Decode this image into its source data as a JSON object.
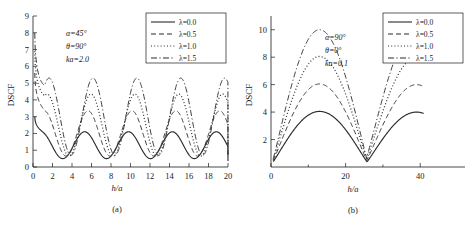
{
  "figure": {
    "panels": [
      {
        "caption": "(a)",
        "annotations": [
          "α=45°",
          "θ=90°",
          "ka=2.0"
        ],
        "xlabel": "h/a",
        "ylabel": "DSCF"
      },
      {
        "caption": "(b)",
        "annotations": [
          "α=90°",
          "θ=0°",
          "ka=0.1"
        ],
        "xlabel": "h/a",
        "ylabel": "DSCF"
      }
    ],
    "legend_labels": [
      "λ=0.0",
      "λ=0.5",
      "λ=1.0",
      "λ=1.5"
    ]
  },
  "chart_data": [
    {
      "type": "line",
      "title": "",
      "panel": "(a)",
      "xlabel": "h/a",
      "ylabel": "DSCF",
      "xlim": [
        0,
        20
      ],
      "ylim": [
        0,
        9
      ],
      "xticks": [
        0,
        2,
        4,
        6,
        8,
        10,
        12,
        14,
        16,
        18,
        20
      ],
      "yticks": [
        0,
        1,
        2,
        3,
        4,
        5,
        6,
        7,
        8,
        9
      ],
      "grid": false,
      "legend_position": "top-right",
      "annotations": [
        "α=45°",
        "θ=90°",
        "ka=2.0"
      ],
      "series": [
        {
          "name": "λ=0.0",
          "style": "solid",
          "mean": 1.3,
          "amplitude": 0.8,
          "period": 4.5,
          "phase_x0": 3.05,
          "start_value": 3.0,
          "peak_values": [
            2.1,
            2.1,
            2.1,
            2.1,
            2.1
          ],
          "trough_values": [
            0.45,
            0.45,
            0.45,
            0.45
          ],
          "peak_x": [
            1.7,
            6.2,
            10.7,
            15.2,
            19.3
          ],
          "trough_x": [
            4.0,
            8.5,
            13.0,
            17.5
          ]
        },
        {
          "name": "λ=0.5",
          "style": "dashed",
          "mean": 2.0,
          "amplitude": 1.35,
          "period": 4.5,
          "phase_x0": 3.4,
          "start_value": 5.6,
          "peak_values": [
            3.4,
            3.4,
            3.4,
            3.4,
            3.4
          ],
          "trough_values": [
            0.7,
            0.7,
            0.7,
            0.7
          ],
          "peak_x": [
            2.5,
            7.0,
            11.5,
            16.0,
            19.6
          ],
          "trough_x": [
            4.6,
            9.1,
            13.6,
            18.1
          ]
        },
        {
          "name": "λ=1.0",
          "style": "dotted",
          "mean": 2.5,
          "amplitude": 1.85,
          "period": 4.5,
          "phase_x0": 3.7,
          "start_value": 6.9,
          "peak_values": [
            4.35,
            4.35,
            4.35,
            4.35,
            4.35
          ],
          "trough_values": [
            0.85,
            0.85,
            0.85,
            0.85
          ],
          "peak_x": [
            2.7,
            7.2,
            11.7,
            16.2,
            19.7
          ],
          "trough_x": [
            4.8,
            9.3,
            13.8,
            18.3
          ]
        },
        {
          "name": "λ=1.5",
          "style": "dash-dot",
          "mean": 3.0,
          "amplitude": 2.3,
          "period": 4.5,
          "phase_x0": 3.9,
          "start_value": 8.0,
          "peak_values": [
            5.3,
            5.3,
            5.3,
            5.3,
            5.3
          ],
          "trough_values": [
            1.0,
            1.0,
            1.0,
            1.0
          ],
          "peak_x": [
            2.9,
            7.4,
            11.9,
            16.4,
            19.8
          ],
          "trough_x": [
            5.0,
            9.5,
            14.0,
            18.5
          ]
        }
      ]
    },
    {
      "type": "line",
      "title": "",
      "panel": "(b)",
      "xlabel": "h/a",
      "ylabel": "DSCF",
      "xlim": [
        0,
        52
      ],
      "ylim": [
        0,
        11
      ],
      "xticks": [
        0,
        20,
        40
      ],
      "xticks_minor": [
        10,
        30
      ],
      "yticks": [
        2,
        4,
        6,
        8,
        10
      ],
      "grid": false,
      "legend_position": "top-right",
      "annotations": [
        "α=90°",
        "θ=0°",
        "ka=0.1"
      ],
      "series": [
        {
          "name": "λ=0.0",
          "style": "solid",
          "peak_values": [
            4.05,
            4.0
          ],
          "peak_x": [
            13,
            39
          ],
          "trough_values": [
            0.35,
            0.4
          ],
          "trough_x": [
            0.5,
            25.8
          ],
          "end_x": 41,
          "end_value": 3.8
        },
        {
          "name": "λ=0.5",
          "style": "dashed",
          "peak_values": [
            6.05,
            6.0
          ],
          "peak_x": [
            13,
            39
          ],
          "trough_values": [
            0.4,
            0.55
          ],
          "trough_x": [
            0.5,
            25.8
          ],
          "end_x": 41,
          "end_value": 5.6
        },
        {
          "name": "λ=1.0",
          "style": "dotted",
          "peak_values": [
            8.05,
            8.0
          ],
          "peak_x": [
            13,
            39
          ],
          "trough_values": [
            0.45,
            0.7
          ],
          "trough_x": [
            0.5,
            25.8
          ],
          "end_x": 41,
          "end_value": 7.5
        },
        {
          "name": "λ=1.5",
          "style": "dash-dot",
          "peak_values": [
            10.0,
            10.05
          ],
          "peak_x": [
            13,
            39
          ],
          "trough_values": [
            0.5,
            0.85
          ],
          "trough_x": [
            0.5,
            25.8
          ],
          "end_x": 41,
          "end_value": 9.4
        }
      ]
    }
  ]
}
